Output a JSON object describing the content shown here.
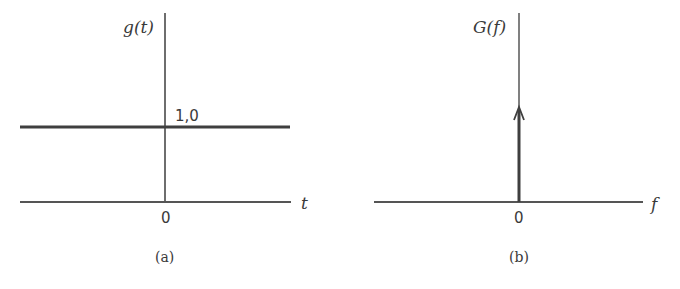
{
  "figure": {
    "panels": [
      {
        "id": "a",
        "caption": "(a)",
        "y_label": "g(t)",
        "x_label": "t",
        "origin_label": "0",
        "level_label": "1,0"
      },
      {
        "id": "b",
        "caption": "(b)",
        "y_label": "G(f)",
        "x_label": "f",
        "origin_label": "0"
      }
    ]
  },
  "colors": {
    "line": "#4a4a4a",
    "text": "#3a3a3a",
    "background": "#ffffff"
  }
}
